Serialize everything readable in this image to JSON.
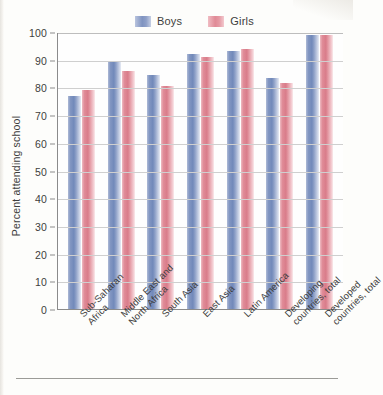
{
  "chart_data": {
    "type": "bar",
    "title": "",
    "xlabel": "",
    "ylabel": "Percent attending school",
    "ylim": [
      0,
      100
    ],
    "ytick_step": 10,
    "yticks": [
      0,
      10,
      20,
      30,
      40,
      50,
      60,
      70,
      80,
      90,
      100
    ],
    "grid": true,
    "legend_position": "top-center",
    "categories": [
      "Sub-Saharan\nAfrica",
      "Middle East and\nNorth Africa",
      "South Asia",
      "East Asia",
      "Latin America",
      "Developing\ncountries, total",
      "Developed\ncountries, total"
    ],
    "series": [
      {
        "name": "Boys",
        "color": "#7f93c0",
        "values": [
          77,
          89,
          84.5,
          92,
          93,
          83.5,
          99
        ]
      },
      {
        "name": "Girls",
        "color": "#e08a96",
        "values": [
          79,
          86,
          80.5,
          91,
          94,
          81.5,
          99
        ]
      }
    ]
  },
  "legend": {
    "items": [
      {
        "label": "Boys"
      },
      {
        "label": "Girls"
      }
    ]
  },
  "axis": {
    "y_title": "Percent attending school"
  }
}
